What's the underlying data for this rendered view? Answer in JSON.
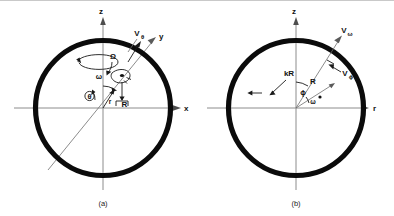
{
  "figure": {
    "background_color": "#ffffff",
    "ring_color": "#0b0b0b",
    "axis_color": "#8c8c8c",
    "annotation_color": "#1a1a1a",
    "panels": [
      {
        "id": "a",
        "caption": "(a)",
        "axes": [
          {
            "name": "z-axis",
            "label": "z",
            "direction": "up"
          },
          {
            "name": "x-axis",
            "label": "x",
            "direction": "right"
          },
          {
            "name": "y-axis",
            "label": "y",
            "direction": "upper-right-oblique"
          }
        ],
        "vectors": [
          {
            "name": "v-theta",
            "base": "V",
            "subscript": "θ"
          }
        ],
        "symbols": [
          {
            "name": "omega-angle",
            "label": "ω"
          },
          {
            "name": "theta-angle",
            "label": "θ"
          },
          {
            "name": "capital-omega-spin",
            "label": "Ω"
          },
          {
            "name": "radius-r",
            "label": "r"
          },
          {
            "name": "radius-R",
            "label": "R"
          }
        ]
      },
      {
        "id": "b",
        "caption": "(b)",
        "axes": [
          {
            "name": "z-axis",
            "label": "z",
            "direction": "up"
          },
          {
            "name": "r-axis",
            "label": "r",
            "direction": "right"
          }
        ],
        "vectors": [
          {
            "name": "v-omega",
            "base": "V",
            "subscript": "ω"
          },
          {
            "name": "v-phi",
            "base": "V",
            "subscript": "ϕ"
          }
        ],
        "symbols": [
          {
            "name": "phi-angle",
            "label": "ϕ"
          },
          {
            "name": "omega-angle",
            "label": "ω"
          },
          {
            "name": "length-kR",
            "label": "kR"
          },
          {
            "name": "length-R",
            "label": "R"
          }
        ]
      }
    ]
  },
  "labels": {
    "panel_a": {
      "axis_z": "z",
      "axis_x": "x",
      "axis_y": "y",
      "v_base": "V",
      "v_sub": "θ",
      "omega": "ω",
      "theta": "θ",
      "big_omega": "Ω",
      "r": "r",
      "R": "R",
      "caption": "(a)"
    },
    "panel_b": {
      "axis_z": "z",
      "axis_r": "r",
      "v_omega_base": "V",
      "v_omega_sub": "ω",
      "v_phi_base": "V",
      "v_phi_sub": "ϕ",
      "phi": "ϕ",
      "omega": "ω",
      "kR": "kR",
      "R": "R",
      "caption": "(b)"
    }
  }
}
